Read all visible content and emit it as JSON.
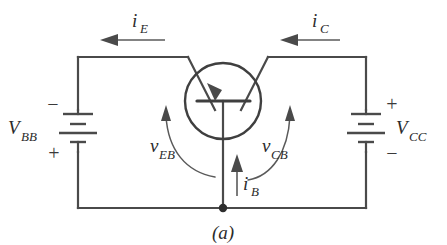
{
  "figure": {
    "caption": "(a)",
    "type": "circuit-schematic"
  },
  "currents": {
    "emitter": {
      "symbol": "i",
      "subscript": "E",
      "direction": "left"
    },
    "collector": {
      "symbol": "i",
      "subscript": "C",
      "direction": "left"
    },
    "base": {
      "symbol": "i",
      "subscript": "B",
      "direction": "up"
    }
  },
  "voltages": {
    "emitter_base": {
      "symbol": "v",
      "subscript": "EB"
    },
    "collector_base": {
      "symbol": "v",
      "subscript": "CB"
    }
  },
  "sources": {
    "left": {
      "symbol": "V",
      "subscript": "BB",
      "top_terminal": "−",
      "bottom_terminal": "+"
    },
    "right": {
      "symbol": "V",
      "subscript": "CC",
      "top_terminal": "+",
      "bottom_terminal": "−"
    }
  },
  "colors": {
    "wire": "#4a4a4a",
    "device": "#3f3f3f",
    "annotation": "#5a5a5a",
    "text": "#2b2b2b",
    "background": "#ffffff"
  }
}
